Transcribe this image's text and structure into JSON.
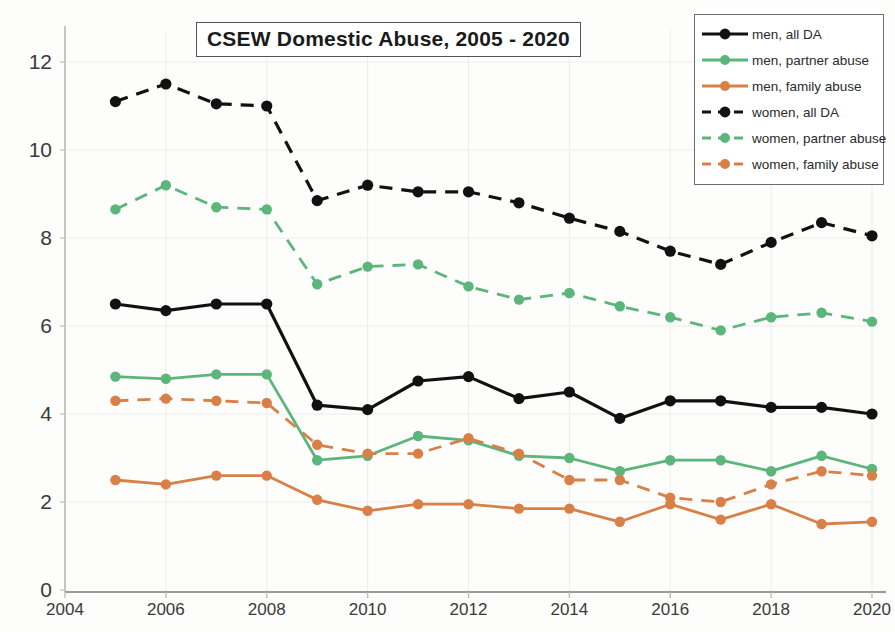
{
  "title": "CSEW Domestic Abuse, 2005 - 2020",
  "legend": {
    "position": "top-right",
    "items": [
      {
        "label": "men, all DA",
        "color": "#111111",
        "style": "solid"
      },
      {
        "label": "men, partner abuse",
        "color": "#5cb57a",
        "style": "solid"
      },
      {
        "label": "men, family abuse",
        "color": "#d98048",
        "style": "solid"
      },
      {
        "label": "women, all DA",
        "color": "#111111",
        "style": "dashed"
      },
      {
        "label": "women, partner abuse",
        "color": "#5cb57a",
        "style": "dashed"
      },
      {
        "label": "women, family abuse",
        "color": "#d98048",
        "style": "dashed"
      }
    ]
  },
  "axes": {
    "x_ticks": [
      "2004",
      "2006",
      "2008",
      "2010",
      "2012",
      "2014",
      "2016",
      "2018",
      "2020"
    ],
    "y_ticks": [
      "0",
      "2",
      "4",
      "6",
      "8",
      "10",
      "12"
    ],
    "xlim": [
      2004,
      2020
    ],
    "ylim": [
      0,
      12.6
    ]
  },
  "chart_data": {
    "type": "line",
    "title": "CSEW Domestic Abuse, 2005 - 2020",
    "xlabel": "",
    "ylabel": "",
    "xlim": [
      2004,
      2020
    ],
    "ylim": [
      0,
      12.6
    ],
    "grid": true,
    "legend_position": "top-right",
    "x": [
      2005,
      2006,
      2007,
      2008,
      2009,
      2010,
      2011,
      2012,
      2013,
      2014,
      2015,
      2016,
      2017,
      2018,
      2019,
      2020
    ],
    "series": [
      {
        "name": "men, all DA",
        "color": "#111111",
        "style": "solid",
        "values": [
          6.5,
          6.35,
          6.5,
          6.5,
          4.2,
          4.1,
          4.75,
          4.85,
          4.35,
          4.5,
          3.9,
          4.3,
          4.3,
          4.15,
          4.15,
          4.0
        ]
      },
      {
        "name": "men, partner abuse",
        "color": "#5cb57a",
        "style": "solid",
        "values": [
          4.85,
          4.8,
          4.9,
          4.9,
          2.95,
          3.05,
          3.5,
          3.4,
          3.05,
          3.0,
          2.7,
          2.95,
          2.95,
          2.7,
          3.05,
          2.75
        ]
      },
      {
        "name": "men, family abuse",
        "color": "#d98048",
        "style": "solid",
        "values": [
          2.5,
          2.4,
          2.6,
          2.6,
          2.05,
          1.8,
          1.95,
          1.95,
          1.85,
          1.85,
          1.55,
          1.95,
          1.6,
          1.95,
          1.5,
          1.55
        ]
      },
      {
        "name": "women, all DA",
        "color": "#111111",
        "style": "dashed",
        "values": [
          11.1,
          11.5,
          11.05,
          11.0,
          8.85,
          9.2,
          9.05,
          9.05,
          8.8,
          8.45,
          8.15,
          7.7,
          7.4,
          7.9,
          8.35,
          8.05
        ]
      },
      {
        "name": "women, partner abuse",
        "color": "#5cb57a",
        "style": "dashed",
        "values": [
          8.65,
          9.2,
          8.7,
          8.65,
          6.95,
          7.35,
          7.4,
          6.9,
          6.6,
          6.75,
          6.45,
          6.2,
          5.9,
          6.2,
          6.3,
          6.1
        ]
      },
      {
        "name": "women, family abuse",
        "color": "#d98048",
        "style": "dashed",
        "values": [
          4.3,
          4.35,
          4.3,
          4.25,
          3.3,
          3.1,
          3.1,
          3.45,
          3.1,
          2.5,
          2.5,
          2.1,
          2.0,
          2.4,
          2.7,
          2.6
        ]
      }
    ]
  }
}
